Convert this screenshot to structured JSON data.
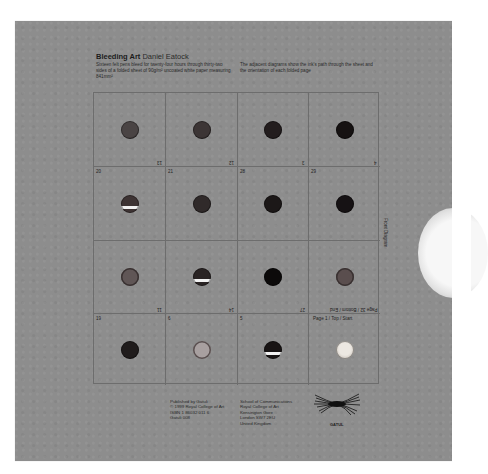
{
  "header": {
    "title": "Bleeding Art",
    "author": "Daniel Eatock",
    "description_left": "Sixteen felt pens bleed for twenty-four hours through thirty-two sides of a folded sheet of 90g/m² uncoated white paper measuring 841mm²",
    "description_right": "The adjacent diagrams show the ink's path through the sheet and the orientation of each folded page"
  },
  "side_label": "Front Diagram",
  "grid": {
    "cells": [
      {
        "row": 0,
        "col": 0,
        "top_left": "",
        "bottom_right": "13",
        "hole_color": "#4a4444",
        "hole_style": "solid"
      },
      {
        "row": 0,
        "col": 1,
        "top_left": "",
        "bottom_right": "12",
        "hole_color": "#3c3535",
        "hole_style": "solid"
      },
      {
        "row": 0,
        "col": 2,
        "top_left": "",
        "bottom_right": "3",
        "hole_color": "#231d1e",
        "hole_style": "solid"
      },
      {
        "row": 0,
        "col": 3,
        "top_left": "",
        "bottom_right": "4",
        "hole_color": "#161212",
        "hole_style": "solid"
      },
      {
        "row": 1,
        "col": 0,
        "top_left": "20",
        "bottom_right": "",
        "hole_color": "#3e3434",
        "hole_style": "bleed-white"
      },
      {
        "row": 1,
        "col": 1,
        "top_left": "21",
        "bottom_right": "",
        "hole_color": "#302a2a",
        "hole_style": "solid"
      },
      {
        "row": 1,
        "col": 2,
        "top_left": "28",
        "bottom_right": "",
        "hole_color": "#1c1818",
        "hole_style": "solid"
      },
      {
        "row": 1,
        "col": 3,
        "top_left": "29",
        "bottom_right": "",
        "hole_color": "#161214",
        "hole_style": "solid"
      },
      {
        "row": 2,
        "col": 0,
        "top_left": "",
        "bottom_right": "11",
        "hole_color": "#605656",
        "hole_style": "ring"
      },
      {
        "row": 2,
        "col": 1,
        "top_left": "",
        "bottom_right": "14",
        "hole_color": "#2a2424",
        "hole_style": "bleed-white"
      },
      {
        "row": 2,
        "col": 2,
        "top_left": "",
        "bottom_right": "27",
        "hole_color": "#0c0a0a",
        "hole_style": "solid"
      },
      {
        "row": 2,
        "col": 3,
        "top_left": "",
        "bottom_right": "Page 32 / Bottom / End",
        "hole_color": "#5a4e4e",
        "hole_style": "ring"
      },
      {
        "row": 3,
        "col": 0,
        "top_left": "19",
        "bottom_right": "",
        "hole_color": "#201c1c",
        "hole_style": "solid"
      },
      {
        "row": 3,
        "col": 1,
        "top_left": "6",
        "bottom_right": "",
        "hole_color": "#9a9090",
        "hole_style": "light-ring"
      },
      {
        "row": 3,
        "col": 2,
        "top_left": "5",
        "bottom_right": "",
        "hole_color": "#181414",
        "hole_style": "bleed-white"
      },
      {
        "row": 3,
        "col": 3,
        "top_left": "Page 1 / Top / Start",
        "bottom_right": "",
        "hole_color": "#cfc8c0",
        "hole_style": "pale"
      }
    ]
  },
  "colophon": {
    "publisher": "Published by Gatuli\n© 1999 Royal College of Art\nISBN 1 86032 011 6\nGatuli 008",
    "address": "School of Communications\nRoyal College of Art\nKensington Gore\nLondon SW7 2EU\nUnited Kingdom",
    "logo_text": "GATUL"
  },
  "colors": {
    "board": "#8d8d8d",
    "grid_lines": "#6d6d6d",
    "text": "#1c1c1c"
  }
}
